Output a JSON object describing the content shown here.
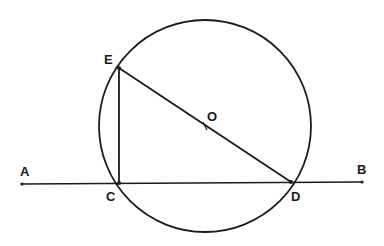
{
  "figure": {
    "type": "geometry",
    "stroke_color": "#1a1a1a",
    "background": "#ffffff"
  },
  "circle": {
    "name": "circle-O",
    "cx": 205,
    "cy": 126,
    "r": 106
  },
  "points": {
    "A": {
      "label": "A",
      "x": 22,
      "y": 184
    },
    "B": {
      "label": "B",
      "x": 362,
      "y": 182
    },
    "C": {
      "label": "C",
      "x": 119,
      "y": 183
    },
    "D": {
      "label": "D",
      "x": 291,
      "y": 182
    },
    "E": {
      "label": "E",
      "x": 119,
      "y": 68
    },
    "O": {
      "label": "O",
      "x": 205,
      "y": 126
    }
  },
  "segments": [
    {
      "name": "line-AB",
      "from": "A",
      "to": "B"
    },
    {
      "name": "segment-EC",
      "from": "E",
      "to": "C"
    },
    {
      "name": "segment-ED",
      "from": "E",
      "to": "D"
    }
  ],
  "labels": {
    "A": "A",
    "B": "B",
    "C": "C",
    "D": "D",
    "E": "E",
    "O": "O"
  }
}
